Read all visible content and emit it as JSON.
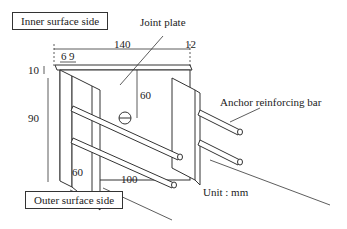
{
  "labels": {
    "inner_surface": "Inner surface side",
    "outer_surface": "Outer surface side",
    "joint_plate": "Joint plate",
    "anchor_bar": "Anchor reinforcing bar",
    "unit": "Unit : mm"
  },
  "dimensions": {
    "width_total": "140",
    "thickness_right": "12",
    "offset_a": "6",
    "offset_b": "9",
    "top_thickness": "10",
    "height": "90",
    "hole_depth": "60",
    "plate_depth": "60",
    "bar_length": "100"
  }
}
